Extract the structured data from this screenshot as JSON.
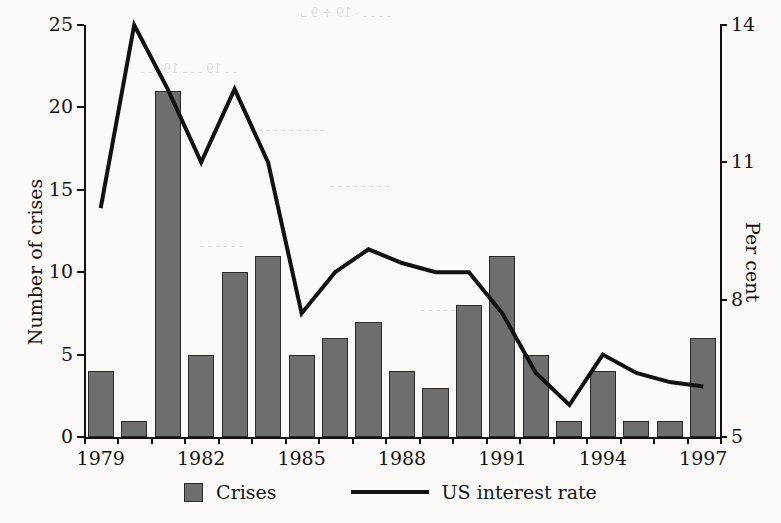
{
  "chart_data": {
    "type": "bar",
    "title": "",
    "xlabel": "",
    "ylabel": "Number of crises",
    "y2label": "Per cent",
    "categories": [
      1979,
      1980,
      1981,
      1982,
      1983,
      1984,
      1985,
      1986,
      1987,
      1988,
      1989,
      1990,
      1991,
      1992,
      1993,
      1994,
      1995,
      1996,
      1997
    ],
    "xtick_labels": [
      "1979",
      "1982",
      "1985",
      "1988",
      "1991",
      "1994",
      "1997"
    ],
    "xtick_years": [
      1979,
      1982,
      1985,
      1988,
      1991,
      1994,
      1997
    ],
    "ylim": [
      0,
      25
    ],
    "ytick_labels": [
      "0",
      "5",
      "10",
      "15",
      "20",
      "25"
    ],
    "ytick_values": [
      0,
      5,
      10,
      15,
      20,
      25
    ],
    "y2lim": [
      5,
      14
    ],
    "y2tick_labels": [
      "5",
      "8",
      "11",
      "14"
    ],
    "y2tick_values": [
      5,
      8,
      11,
      14
    ],
    "grid": false,
    "legend_position": "bottom",
    "series": [
      {
        "name": "Crises",
        "type": "bar",
        "axis": "left",
        "color": "#6e6e6e",
        "values": [
          4,
          1,
          21,
          5,
          10,
          11,
          5,
          6,
          7,
          4,
          3,
          8,
          11,
          5,
          1,
          4,
          1,
          1,
          6
        ]
      },
      {
        "name": "US interest rate",
        "type": "line",
        "axis": "right",
        "color": "#111111",
        "values": [
          10.0,
          14.0,
          12.6,
          11.0,
          12.6,
          11.0,
          7.7,
          8.6,
          9.1,
          8.8,
          8.6,
          8.6,
          7.7,
          6.4,
          5.7,
          6.8,
          6.4,
          6.2,
          6.1
        ]
      }
    ]
  },
  "legend": {
    "items": [
      {
        "label": "Crises",
        "marker": "square-swatch"
      },
      {
        "label": "US interest rate",
        "marker": "line-swatch"
      }
    ]
  },
  "ghost_text": {
    "rows": [
      "بـ 9 + 19 - ـ ـ ـ ـ",
      "ـ ـ ـ 19 ـ ـ ـ 19 ـ ـ",
      "ـ ـ ـ ـ ـ ـ ـ ـ ـ ـ",
      "ـ ـ ـ ـ ـ ـ ـ ـ",
      "ـ ـ ـ ـ ـ ـ",
      "ـ ـ ـ ـ ـ ـ ـ ـ"
    ]
  }
}
